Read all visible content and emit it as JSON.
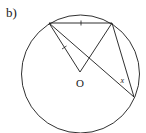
{
  "figure": {
    "part_label": "b)",
    "center_label": "O",
    "angle_label": "x",
    "stroke_color": "#1a1a1a",
    "background": "#ffffff",
    "circle": {
      "cx": 80.5,
      "cy": 74,
      "r": 59
    },
    "points": {
      "A": {
        "x": 49,
        "y": 23
      },
      "B": {
        "x": 112,
        "y": 23
      },
      "O": {
        "x": 80,
        "y": 72
      },
      "C": {
        "x": 134,
        "y": 97
      }
    },
    "segments": [
      "A-B",
      "A-O",
      "O-B",
      "A-C",
      "B-C"
    ],
    "equal_marks": [
      "A-B",
      "A-O"
    ]
  }
}
